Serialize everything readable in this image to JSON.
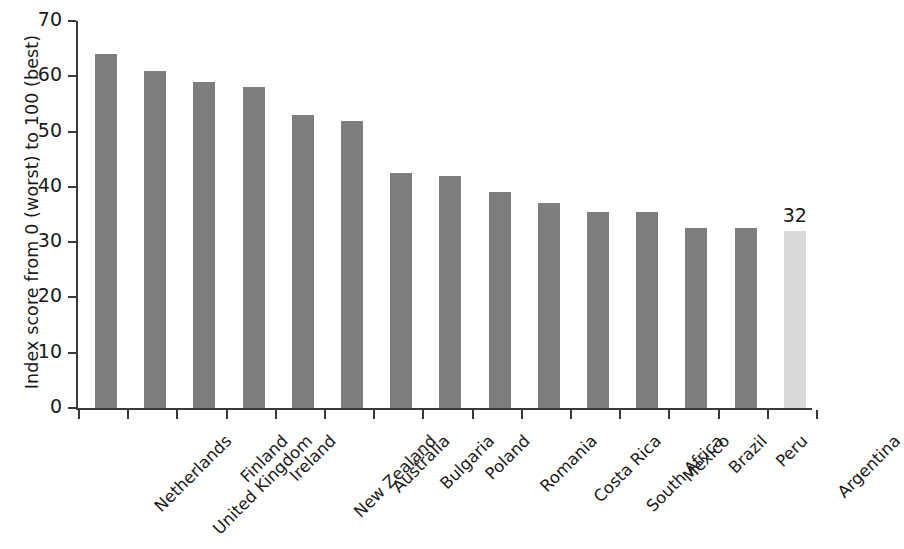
{
  "chart_data": {
    "type": "bar",
    "title": "",
    "subtitle": "",
    "xlabel": "",
    "ylabel": "Index score from 0 (worst) to 100 (best)",
    "ylim": [
      0,
      70
    ],
    "yticks": [
      0,
      10,
      20,
      30,
      40,
      50,
      60,
      70
    ],
    "ytick_labels": [
      "0",
      "10",
      "20",
      "30",
      "40",
      "50",
      "60",
      "70"
    ],
    "grid": false,
    "legend": null,
    "bar_color": "#7d7d7d",
    "highlight_color": "#d9d9d9",
    "highlight_category": "Argentina",
    "categories": [
      "Netherlands",
      "United Kingdom",
      "Finland",
      "Ireland",
      "New Zealand",
      "Australia",
      "Bulgaria",
      "Poland",
      "Romania",
      "Costa Rica",
      "South Africa",
      "Mexico",
      "Brazil",
      "Peru",
      "Argentina"
    ],
    "values": [
      64,
      61,
      59,
      58,
      53,
      52,
      42.5,
      42,
      39,
      37,
      35.5,
      35.5,
      32.5,
      32.5,
      32
    ],
    "annotations": [
      {
        "category": "Argentina",
        "label": "32"
      }
    ]
  }
}
